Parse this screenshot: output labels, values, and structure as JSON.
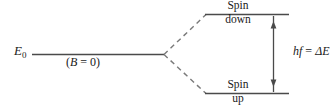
{
  "figure": {
    "title_alt": "Spin energy level splitting diagram",
    "ground_level": {
      "symbol": "E",
      "subscript": "0",
      "field_note_open": "(",
      "field_note_symbol": "B",
      "field_note_rest": " = 0)"
    },
    "upper_level": {
      "line1": "Spin",
      "line2": "down"
    },
    "lower_level": {
      "line1": "Spin",
      "line2": "up"
    },
    "transition": {
      "photon": "hf",
      "equals": " = ",
      "delta_energy": "ΔE"
    }
  },
  "colors": {
    "stroke": "#4a4a4a",
    "text": "#1a1a1a",
    "background": "#ffffff"
  }
}
